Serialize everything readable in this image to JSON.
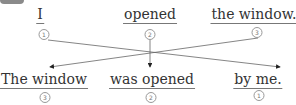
{
  "top_row": [
    {
      "text": "I",
      "order": "1"
    },
    {
      "text": "opened",
      "order": "2"
    },
    {
      "text": "the window.",
      "order": "3"
    }
  ],
  "bottom_row": [
    {
      "text": "The window",
      "order": "3"
    },
    {
      "text": "was opened",
      "order": "2"
    },
    {
      "text": "by me.",
      "order": "1"
    }
  ],
  "connections": [
    {
      "from": "top.1",
      "to": "bottom.3"
    },
    {
      "from": "top.2",
      "to": "bottom.2"
    },
    {
      "from": "top.3",
      "to": "bottom.1"
    }
  ],
  "colors": {
    "text": "#333333",
    "line": "#555555",
    "tab": "#8a8a8a"
  }
}
